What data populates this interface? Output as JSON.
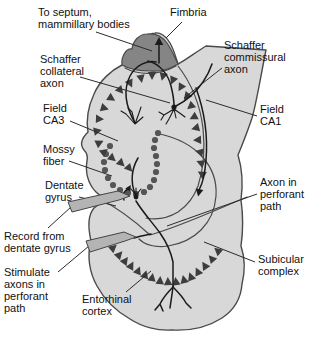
{
  "figure": {
    "colors": {
      "background": "#ffffff",
      "region_fill": "#d8d8d8",
      "region_stroke": "#4a4a4a",
      "fimbria_fill": "#858585",
      "cell_color": "#3d3d3d",
      "dot_color": "#555555",
      "axon_color": "#1a1a1a",
      "leader_color": "#2b2b2b",
      "electrode_fill": "#b4b4b4",
      "electrode_stroke": "#444444",
      "text_color": "#111111"
    },
    "labels": [
      {
        "id": "to-septum-mammillary-bodies",
        "text": "To septum,\nmammillary bodies",
        "x": 38,
        "y": 6,
        "leader": [
          [
            96,
            32
          ],
          [
            152,
            51
          ]
        ]
      },
      {
        "id": "fimbria",
        "text": "Fimbria",
        "x": 170,
        "y": 6,
        "leader": [
          [
            182,
            22
          ],
          [
            166,
            38
          ]
        ]
      },
      {
        "id": "schaffer-commissural-axon",
        "text": "Schaffer\ncommissural\naxon",
        "x": 224,
        "y": 39,
        "leader": [
          [
            222,
            68
          ],
          [
            184,
            98
          ]
        ]
      },
      {
        "id": "field-ca1",
        "text": "Field\nCA1",
        "x": 260,
        "y": 103,
        "leader": [
          [
            257,
            116
          ],
          [
            206,
            100
          ]
        ]
      },
      {
        "id": "axon-in-perforant-path",
        "text": "Axon in\nperforant\npath",
        "x": 260,
        "y": 176,
        "leader": [
          [
            257,
            194
          ],
          [
            167,
            226
          ]
        ]
      },
      {
        "id": "subicular-complex",
        "text": "Subicular\ncomplex",
        "x": 258,
        "y": 253,
        "leader": [
          [
            255,
            262
          ],
          [
            204,
            242
          ]
        ]
      },
      {
        "id": "schaffer-collateral-axon",
        "text": "Schaffer\ncollateral\naxon",
        "x": 40,
        "y": 53,
        "leader": [
          [
            80,
            77
          ],
          [
            170,
            103
          ]
        ]
      },
      {
        "id": "field-ca3",
        "text": "Field\nCA3",
        "x": 43,
        "y": 102,
        "leader": [
          [
            70,
            121
          ],
          [
            118,
            141
          ]
        ]
      },
      {
        "id": "mossy-fiber",
        "text": "Mossy\nfiber",
        "x": 43,
        "y": 143,
        "leader": [
          [
            69,
            161
          ],
          [
            112,
            176
          ]
        ]
      },
      {
        "id": "dentate-gyrus",
        "text": "Dentate\ngyrus",
        "x": 45,
        "y": 179,
        "leader": [
          [
            79,
            197
          ],
          [
            116,
            206
          ]
        ]
      },
      {
        "id": "record-from-dentate-gyrus",
        "text": "Record from\ndentate gyrus",
        "x": 4,
        "y": 230,
        "leader": [
          [
            48,
            228
          ],
          [
            71,
            207
          ]
        ]
      },
      {
        "id": "stimulate-axons-in-perforant-path",
        "text": "Stimulate\naxons in\nperforant\npath",
        "x": 4,
        "y": 266,
        "leader": [
          [
            58,
            272
          ],
          [
            89,
            246
          ]
        ]
      },
      {
        "id": "entorhinal-cortex",
        "text": "Entorhinal\ncortex",
        "x": 82,
        "y": 293,
        "leader": [
          [
            126,
            292
          ],
          [
            151,
            271
          ]
        ]
      }
    ],
    "geometry": {
      "outer_path": "M122,65 C112,70 100,80 94,94 C88,107 86,120 88,132 C82,138 79,144 84,150 C87,153 88,156 87,161 C85,172 88,184 96,192 C100,196 104,198 110,199 C106,201 99,203 94,208 C88,215 88,228 91,241 C87,255 89,272 97,286 C104,299 116,311 130,319 C142,327 158,331 172,330 C190,331 208,327 222,318 C234,310 241,298 242,284 C245,272 245,258 241,246 C243,232 243,214 241,200 C243,185 242,168 238,155 C243,143 248,130 252,118 C256,105 260,80 266,50 L206,46 C196,52 186,60 178,64 C176,58 174,50 170,43 C166,36 160,32 155,33 C148,34 142,40 140,48 C134,47 128,55 128,60 Z",
      "cap_path": "M122,65 C121,57 126,48 132,49 C133,41 139,34 147,34 C155,33 162,36 167,43 C172,50 175,58 178,64 C170,69 160,72 150,71 C139,71 129,69 122,65 Z",
      "interior_paths": [
        "M125,68 C138,75 158,76 176,66",
        "M178,66 C192,84 200,105 203,128 C205,148 204,168 198,186 C194,197 187,206 178,212 C168,218 156,220 146,218",
        "M160,134 C196,142 218,166 216,196 C214,224 194,242 168,246 C154,248 144,244 139,239",
        "M98,198 C118,208 136,222 150,235 C182,226 220,208 247,197"
      ],
      "axon_paths": [
        "M135,123 C126,107 123,90 130,76 C136,65 147,60 156,62",
        "M159,63 L159,45",
        "M148,61 C160,64 168,74 171,86 C173,94 174,100 174,106",
        "M176,106 C186,101 196,92 203,82 C207,76 210,70 212,64",
        "M196,88 C204,110 208,136 206,160 C205,173 203,183 199,190",
        "M136,201 C142,211 151,221 160,233 C167,243 171,252 173,262 L173,287",
        "M173,287 C168,292 163,298 160,304 M160,304 L155,310 M160,304 L163,311",
        "M173,287 C172,295 171,301 170,308",
        "M173,287 C178,292 183,297 186,303 M186,303 L191,308",
        "M135,194 C131,183 131,170 138,158",
        "M134,238 C140,236 146,235 151,234",
        "M124,200 C122,195 124,191 128,189"
      ],
      "neuron_glyphs": [
        "M135,124 L126,114 M135,124 L132,112 M135,124 L139,113 M135,124 L143,117 M126,114 L121,111 M132,112 L128,108 M139,113 L141,107",
        "M174,109 L164,115 M174,109 L169,119 M174,109 L176,118 M174,109 L181,114 M164,115 L159,112 M164,115 L161,120 M169,119 L166,124 M181,114 L185,117",
        "M136,195 L131,189 M136,195 L136,188 M136,195 L141,189"
      ],
      "somata": [
        [
          174,
          107,
          2.6
        ],
        [
          136,
          197,
          2.4
        ]
      ],
      "arrowheads": [
        [
          159,
          42,
          270,
          5
        ],
        [
          199,
          192,
          102,
          4.5
        ],
        [
          129,
          188,
          300,
          3.5
        ]
      ],
      "pyramidal_triangles": [
        [
          152,
          75,
          90
        ],
        [
          141,
          78,
          80
        ],
        [
          130,
          83,
          65
        ],
        [
          120,
          90,
          50
        ],
        [
          111,
          98,
          33
        ],
        [
          104,
          108,
          17
        ],
        [
          99,
          119,
          2
        ],
        [
          97,
          131,
          -12
        ],
        [
          99,
          143,
          -26
        ],
        [
          104,
          152,
          -38
        ],
        [
          112,
          158,
          40
        ],
        [
          121,
          163,
          44
        ],
        [
          129,
          168,
          48
        ],
        [
          163,
          76,
          105
        ],
        [
          173,
          80,
          112
        ],
        [
          181,
          87,
          120
        ],
        [
          187,
          96,
          128
        ],
        [
          191,
          106,
          140
        ],
        [
          194,
          117,
          152
        ],
        [
          196,
          128,
          165
        ],
        [
          198,
          140,
          178
        ],
        [
          200,
          152,
          192
        ],
        [
          201,
          163,
          203
        ],
        [
          202,
          174,
          212
        ]
      ],
      "entorhinal_triangles": [
        [
          113,
          248,
          -40
        ],
        [
          119,
          255,
          -47
        ],
        [
          125,
          261,
          -54
        ],
        [
          131,
          266,
          -61
        ],
        [
          138,
          271,
          -68
        ],
        [
          145,
          275,
          -74
        ],
        [
          152,
          278,
          -80
        ],
        [
          160,
          281,
          -86
        ],
        [
          168,
          282,
          -92
        ],
        [
          176,
          282,
          -98
        ],
        [
          184,
          280,
          -104
        ],
        [
          191,
          277,
          -110
        ],
        [
          198,
          272,
          -116
        ],
        [
          205,
          266,
          -123
        ],
        [
          212,
          259,
          -131
        ],
        [
          218,
          251,
          -139
        ]
      ],
      "granule_dots": [
        [
          110,
          146
        ],
        [
          106,
          154
        ],
        [
          104,
          162
        ],
        [
          105,
          170
        ],
        [
          108,
          178
        ],
        [
          113,
          185
        ],
        [
          120,
          190
        ],
        [
          128,
          193
        ],
        [
          136,
          194
        ],
        [
          144,
          192
        ],
        [
          150,
          187
        ],
        [
          154,
          180
        ],
        [
          156,
          172
        ],
        [
          157,
          164
        ],
        [
          156,
          156
        ],
        [
          154,
          148
        ],
        [
          155,
          140
        ],
        [
          158,
          133
        ]
      ],
      "electrodes": [
        {
          "id": "recording-electrode",
          "points": "68,202 118,191 130,196 119,200 72,212"
        },
        {
          "id": "stimulating-electrode",
          "points": "86,241 124,232 136,237 125,241 90,252"
        }
      ]
    }
  }
}
